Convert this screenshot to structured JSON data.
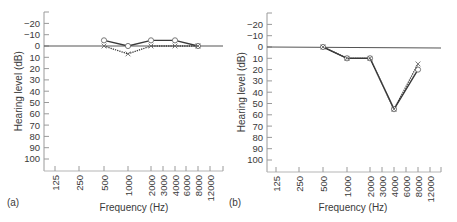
{
  "chart_data": [
    {
      "type": "line",
      "panel_label": "(a)",
      "title": "",
      "xlabel": "Frequency (Hz)",
      "ylabel": "Hearing level (dB)",
      "x_scale": "log",
      "x_ticks": [
        "125",
        "250",
        "500",
        "1000",
        "2000",
        "3000",
        "4000",
        "6000",
        "8000",
        "12000"
      ],
      "y_ticks": [
        "-20",
        "-10",
        "0",
        "10",
        "20",
        "30",
        "40",
        "50",
        "60",
        "70",
        "80",
        "90",
        "100"
      ],
      "ylim": [
        -30,
        110
      ],
      "y_inverted": true,
      "reference_line": 0,
      "grid": false,
      "x": [
        500,
        1000,
        2000,
        4000,
        8000
      ],
      "series": [
        {
          "name": "O (solid line)",
          "marker": "circle",
          "line": "solid",
          "values": [
            -5,
            0,
            -5,
            -5,
            0
          ]
        },
        {
          "name": "X (dotted line)",
          "marker": "cross",
          "line": "dotted",
          "values": [
            0,
            7,
            0,
            0,
            0
          ]
        }
      ]
    },
    {
      "type": "line",
      "panel_label": "(b)",
      "title": "",
      "xlabel": "Frequency (Hz)",
      "ylabel": "Hearing level (dB)",
      "x_scale": "log",
      "x_ticks": [
        "125",
        "250",
        "500",
        "1000",
        "2000",
        "3000",
        "4000",
        "6000",
        "8000",
        "12000"
      ],
      "y_ticks": [
        "-20",
        "-10",
        "0",
        "10",
        "20",
        "30",
        "40",
        "50",
        "60",
        "70",
        "80",
        "90",
        "100"
      ],
      "ylim": [
        -30,
        110
      ],
      "y_inverted": true,
      "reference_line": 0,
      "grid": false,
      "x": [
        500,
        1000,
        2000,
        4000,
        8000
      ],
      "series": [
        {
          "name": "O (solid line)",
          "marker": "circle",
          "line": "solid",
          "values": [
            0,
            10,
            10,
            55,
            20
          ]
        },
        {
          "name": "X (dotted line)",
          "marker": "cross",
          "line": "dotted",
          "values": [
            0,
            10,
            10,
            55,
            15
          ]
        }
      ]
    }
  ],
  "panels": [
    {
      "label": "(a)",
      "xlabel": "Frequency (Hz)",
      "ylabel": "Hearing level (dB)"
    },
    {
      "label": "(b)",
      "xlabel": "Frequency (Hz)",
      "ylabel": "Hearing level (dB)"
    }
  ],
  "colors": {
    "axis": "#9a9a9a",
    "zero_line": "#555555",
    "series": "#3a3a3a",
    "text": "#3a3a3a"
  }
}
